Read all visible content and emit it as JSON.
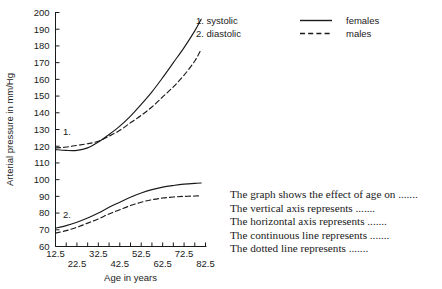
{
  "chart_data": {
    "type": "line",
    "title": "",
    "xlabel": "Age in years",
    "ylabel": "Arterial pressure in mm/Hg",
    "xlim": [
      12.5,
      82.5
    ],
    "ylim": [
      60,
      200
    ],
    "grid": false,
    "x_ticks": [
      12.5,
      17.5,
      22.5,
      27.5,
      32.5,
      37.5,
      42.5,
      47.5,
      52.5,
      57.5,
      62.5,
      67.5,
      72.5,
      77.5,
      82.5
    ],
    "x_tick_labels": [
      "12.5",
      "",
      "22.5",
      "",
      "32.5",
      "",
      "42.5",
      "",
      "52.5",
      "",
      "62.5",
      "",
      "72.5",
      "",
      "82.5"
    ],
    "y_ticks": [
      60,
      70,
      80,
      90,
      100,
      110,
      120,
      130,
      140,
      150,
      160,
      170,
      180,
      190,
      200
    ],
    "y_tick_labels": [
      "60",
      "70",
      "80",
      "90",
      "100",
      "110",
      "120",
      "130",
      "140",
      "150",
      "160",
      "170",
      "180",
      "190",
      "200"
    ],
    "curve_tags": [
      {
        "text": "1.",
        "x": 16.0,
        "y": 127
      },
      {
        "text": "2.",
        "x": 16.0,
        "y": 77
      }
    ],
    "x": [
      12.5,
      17.5,
      22.5,
      27.5,
      32.5,
      37.5,
      42.5,
      47.5,
      52.5,
      57.5,
      62.5,
      67.5,
      72.5,
      77.5,
      80.5
    ],
    "series": [
      {
        "name": "systolic females",
        "measure": "systolic",
        "sex": "females",
        "line": "solid",
        "values": [
          118,
          117.5,
          117.5,
          119,
          122.5,
          127,
          132,
          138,
          145,
          152.5,
          161,
          170,
          179,
          189,
          196
        ]
      },
      {
        "name": "systolic males",
        "measure": "systolic",
        "sex": "males",
        "line": "dashed",
        "values": [
          119,
          119.5,
          120.5,
          121.5,
          123,
          126,
          129.5,
          134,
          138.5,
          143.5,
          149.5,
          155.5,
          162.5,
          171,
          178
        ]
      },
      {
        "name": "diastolic females",
        "measure": "diastolic",
        "sex": "females",
        "line": "solid",
        "values": [
          71,
          72.5,
          74.5,
          77,
          80,
          83.5,
          86.5,
          89.5,
          92,
          94,
          95.5,
          96.5,
          97.3,
          97.8,
          98
        ]
      },
      {
        "name": "diastolic males",
        "measure": "diastolic",
        "sex": "males",
        "line": "dashed",
        "values": [
          68,
          69.5,
          71.5,
          74,
          76.5,
          79.5,
          82,
          84.5,
          86.5,
          88,
          89,
          89.6,
          90,
          90.2,
          90.3
        ]
      }
    ]
  },
  "legend": {
    "rows": [
      {
        "number_label": "1. systolic",
        "sample": "solid-line-sample",
        "label": "females"
      },
      {
        "number_label": "2. diastolic",
        "sample": "dashed-line-sample",
        "label": "males"
      }
    ]
  },
  "prompt": {
    "lines": [
      "The graph shows the effect of age on .......",
      "The vertical axis represents .......",
      "The horizontal axis represents .......",
      "The continuous line represents .......",
      "The dotted line represents ......."
    ]
  },
  "colors": {
    "ink": "#1a1a1a",
    "background": "#ffffff"
  }
}
